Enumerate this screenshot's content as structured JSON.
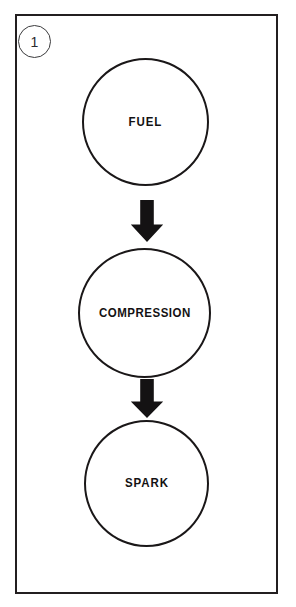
{
  "figure": {
    "number_label": "1",
    "badge_icon": "figure-number-circle"
  },
  "diagram": {
    "type": "flowchart",
    "orientation": "vertical",
    "title": "",
    "stroke_color": "#1a1718",
    "fill_color": "#ffffff",
    "arrow_color": "#141213",
    "frame_color": "#231f20",
    "nodes": [
      {
        "id": "fuel",
        "label": "FUEL",
        "shape": "circle"
      },
      {
        "id": "compression",
        "label": "COMPRESSION",
        "shape": "circle"
      },
      {
        "id": "spark",
        "label": "SPARK",
        "shape": "circle"
      }
    ],
    "connectors": [
      {
        "id": "fuel-to-compression",
        "from": "fuel",
        "to": "compression",
        "icon": "arrow-down-icon"
      },
      {
        "id": "compression-to-spark",
        "from": "compression",
        "to": "spark",
        "icon": "arrow-down-icon"
      }
    ]
  }
}
